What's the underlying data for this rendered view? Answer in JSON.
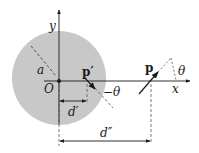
{
  "diagram": {
    "labels": {
      "y_axis": "y",
      "x_axis": "x",
      "origin": "O",
      "radius": "a",
      "dipole_inner": "p′",
      "dipole_outer": "p",
      "angle_inner": "−θ",
      "angle_outer": "θ",
      "distance_inner": "d′",
      "distance_outer": "d″"
    },
    "colors": {
      "sphere_fill": "#c8c8c8",
      "line": "#1a1a1a",
      "dashed": "#555555",
      "background": "#ffffff"
    }
  }
}
